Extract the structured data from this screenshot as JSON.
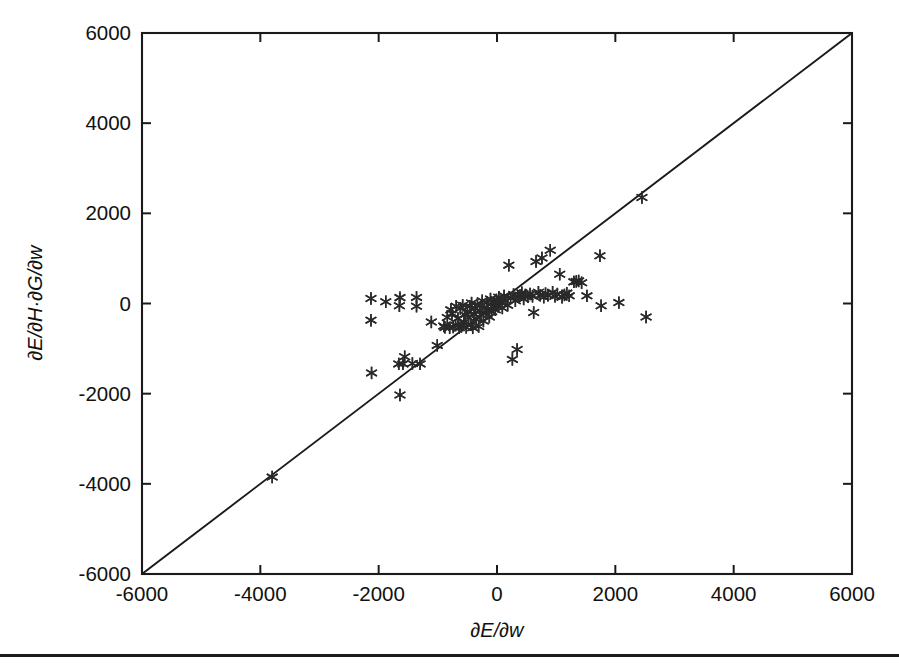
{
  "figure": {
    "background_color": "#ffffff",
    "ink_color": "#1a1a1a",
    "bottom_rule": true
  },
  "chart_data": {
    "type": "scatter",
    "title": "",
    "subtitle": "",
    "xlabel": "∂E/∂w",
    "ylabel": "∂E/∂H·∂G/∂w",
    "xlim": [
      -6000,
      6000
    ],
    "ylim": [
      -6000,
      6000
    ],
    "xticks": [
      -6000,
      -4000,
      -2000,
      0,
      2000,
      4000,
      6000
    ],
    "yticks": [
      -6000,
      -4000,
      -2000,
      0,
      2000,
      4000,
      6000
    ],
    "xtick_labels": [
      "-6000",
      "-4000",
      "-2000",
      "0",
      "2000",
      "4000",
      "6000"
    ],
    "ytick_labels": [
      "-6000",
      "-4000",
      "-2000",
      "0",
      "2000",
      "4000",
      "6000"
    ],
    "grid": false,
    "legend": null,
    "marker": "asterisk",
    "marker_color": "#2a2a2a",
    "reference_line": {
      "name": "identity-line",
      "equation": "y = x",
      "from": [
        -6000,
        -6000
      ],
      "to": [
        6000,
        6000
      ],
      "color": "#1a1a1a"
    },
    "points": [
      [
        -3800,
        -3850
      ],
      [
        -2120,
        -1540
      ],
      [
        -2130,
        110
      ],
      [
        -2130,
        -370
      ],
      [
        -1880,
        40
      ],
      [
        -1640,
        130
      ],
      [
        -1650,
        -50
      ],
      [
        -1660,
        -1340
      ],
      [
        -1640,
        -2030
      ],
      [
        -1590,
        -1340
      ],
      [
        -1560,
        -1180
      ],
      [
        -1430,
        -1330
      ],
      [
        -1360,
        135
      ],
      [
        -1360,
        -60
      ],
      [
        -1300,
        -1340
      ],
      [
        -1110,
        -410
      ],
      [
        -1010,
        -930
      ],
      [
        -900,
        -500
      ],
      [
        -880,
        -530
      ],
      [
        -840,
        -310
      ],
      [
        -800,
        -540
      ],
      [
        -780,
        -140
      ],
      [
        -760,
        -220
      ],
      [
        -740,
        -520
      ],
      [
        -700,
        -480
      ],
      [
        -690,
        -60
      ],
      [
        -660,
        -330
      ],
      [
        -640,
        -540
      ],
      [
        -620,
        -110
      ],
      [
        -600,
        -510
      ],
      [
        -580,
        -40
      ],
      [
        -560,
        -420
      ],
      [
        -540,
        -250
      ],
      [
        -520,
        -530
      ],
      [
        -500,
        -180
      ],
      [
        -480,
        -310
      ],
      [
        -460,
        -60
      ],
      [
        -440,
        -470
      ],
      [
        -430,
        10
      ],
      [
        -410,
        -540
      ],
      [
        -390,
        -230
      ],
      [
        -370,
        -110
      ],
      [
        -350,
        -350
      ],
      [
        -330,
        -30
      ],
      [
        -310,
        -510
      ],
      [
        -290,
        -160
      ],
      [
        -270,
        -250
      ],
      [
        -250,
        60
      ],
      [
        -230,
        -390
      ],
      [
        -210,
        -90
      ],
      [
        -190,
        -210
      ],
      [
        -170,
        30
      ],
      [
        -150,
        -120
      ],
      [
        -130,
        -300
      ],
      [
        -110,
        100
      ],
      [
        -90,
        -180
      ],
      [
        -70,
        -60
      ],
      [
        -50,
        20
      ],
      [
        -30,
        -140
      ],
      [
        -10,
        80
      ],
      [
        10,
        -60
      ],
      [
        30,
        140
      ],
      [
        60,
        20
      ],
      [
        90,
        -100
      ],
      [
        120,
        170
      ],
      [
        150,
        60
      ],
      [
        180,
        -40
      ],
      [
        200,
        850
      ],
      [
        230,
        120
      ],
      [
        260,
        -1240
      ],
      [
        280,
        200
      ],
      [
        310,
        60
      ],
      [
        340,
        -1020
      ],
      [
        360,
        150
      ],
      [
        390,
        180
      ],
      [
        420,
        240
      ],
      [
        450,
        100
      ],
      [
        480,
        190
      ],
      [
        520,
        150
      ],
      [
        560,
        210
      ],
      [
        600,
        160
      ],
      [
        620,
        -200
      ],
      [
        660,
        930
      ],
      [
        700,
        250
      ],
      [
        730,
        180
      ],
      [
        760,
        1010
      ],
      [
        790,
        140
      ],
      [
        820,
        220
      ],
      [
        860,
        180
      ],
      [
        900,
        1180
      ],
      [
        940,
        250
      ],
      [
        980,
        160
      ],
      [
        1020,
        210
      ],
      [
        1060,
        650
      ],
      [
        1100,
        140
      ],
      [
        1140,
        190
      ],
      [
        1180,
        230
      ],
      [
        1220,
        170
      ],
      [
        1300,
        480
      ],
      [
        1340,
        490
      ],
      [
        1380,
        500
      ],
      [
        1430,
        460
      ],
      [
        1520,
        170
      ],
      [
        1740,
        1060
      ],
      [
        1760,
        -50
      ],
      [
        2060,
        20
      ],
      [
        2450,
        2350
      ],
      [
        2520,
        -300
      ]
    ]
  }
}
